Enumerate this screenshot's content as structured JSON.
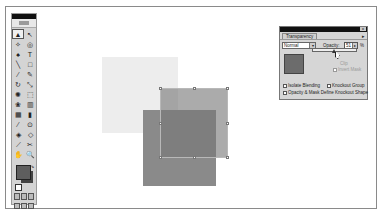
{
  "toolbox": {
    "tools": [
      {
        "name": "selection-tool-icon",
        "glyph": "▲",
        "active": true
      },
      {
        "name": "direct-selection-tool-icon",
        "glyph": "↖"
      },
      {
        "name": "magic-wand-tool-icon",
        "glyph": "✧"
      },
      {
        "name": "lasso-tool-icon",
        "glyph": "◎"
      },
      {
        "name": "pen-tool-icon",
        "glyph": "♠"
      },
      {
        "name": "type-tool-icon",
        "glyph": "T"
      },
      {
        "name": "line-tool-icon",
        "glyph": "╲"
      },
      {
        "name": "rectangle-tool-icon",
        "glyph": "□"
      },
      {
        "name": "paintbrush-tool-icon",
        "glyph": "⁄"
      },
      {
        "name": "pencil-tool-icon",
        "glyph": "✎"
      },
      {
        "name": "rotate-tool-icon",
        "glyph": "↻"
      },
      {
        "name": "scale-tool-icon",
        "glyph": "⤡"
      },
      {
        "name": "warp-tool-icon",
        "glyph": "✺"
      },
      {
        "name": "free-transform-tool-icon",
        "glyph": "⬚"
      },
      {
        "name": "symbol-sprayer-tool-icon",
        "glyph": "❀"
      },
      {
        "name": "graph-tool-icon",
        "glyph": "▥"
      },
      {
        "name": "mesh-tool-icon",
        "glyph": "▦"
      },
      {
        "name": "gradient-tool-icon",
        "glyph": "▮"
      },
      {
        "name": "eyedropper-tool-icon",
        "glyph": "⁄"
      },
      {
        "name": "blend-tool-icon",
        "glyph": "⊙"
      },
      {
        "name": "live-paint-tool-icon",
        "glyph": "◈"
      },
      {
        "name": "live-paint-selection-tool-icon",
        "glyph": "◇"
      },
      {
        "name": "slice-tool-icon",
        "glyph": "⟋"
      },
      {
        "name": "scissors-tool-icon",
        "glyph": "✂"
      },
      {
        "name": "hand-tool-icon",
        "glyph": "✋"
      },
      {
        "name": "zoom-tool-icon",
        "glyph": "🔍"
      }
    ],
    "fill_color": "#5e5e5e",
    "stroke_color": "#444444"
  },
  "artwork": {
    "light_square_color": "#ededed",
    "dark_square_color": "#8a8a8a",
    "front_square_color": "rgba(120,120,120,0.62)"
  },
  "transparency_panel": {
    "tab_label": "Transparency",
    "menu_glyph": "▸",
    "close_glyph": "x",
    "blend_mode": "Normal",
    "blend_arrow": "▾",
    "opacity_label": "Opacity:",
    "opacity_value": "51",
    "opacity_arrow": "▸",
    "percent_sign": "%",
    "clip_label": "Clip",
    "invert_mask_label": "Invert Mask",
    "isolate_blending_label": "Isolate Blending",
    "knockout_group_label": "Knockout Group",
    "opacity_mask_label": "Opacity & Mask Define Knockout Shape"
  }
}
